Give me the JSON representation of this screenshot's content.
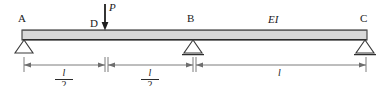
{
  "figure": {
    "type": "structural-beam-diagram",
    "beam": {
      "fill_color": "#d9d9d9",
      "stroke_color": "#404040",
      "stiffness_label": "EI"
    },
    "nodes": [
      {
        "id": "A",
        "label": "A",
        "support": "pin-triangle"
      },
      {
        "id": "D",
        "label": "D",
        "support": "none"
      },
      {
        "id": "B",
        "label": "B",
        "support": "pin-triangle-with-base"
      },
      {
        "id": "C",
        "label": "C",
        "support": "pin-triangle-with-base"
      }
    ],
    "loads": [
      {
        "label": "P",
        "type": "point-load",
        "direction": "down",
        "at": "D"
      }
    ],
    "dimensions": [
      {
        "from": "A",
        "to": "D",
        "numerator": "l",
        "denominator": "2",
        "display": "l/2"
      },
      {
        "from": "D",
        "to": "B",
        "numerator": "l",
        "denominator": "2",
        "display": "l/2"
      },
      {
        "from": "B",
        "to": "C",
        "numerator": "l",
        "denominator": "",
        "display": "l"
      }
    ]
  }
}
